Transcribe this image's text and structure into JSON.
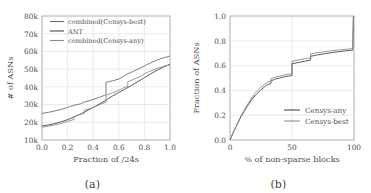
{
  "figure": {
    "panels": [
      {
        "caption": "(a)",
        "chart_data": {
          "type": "line",
          "title": "",
          "xlabel": "Fraction of /24s",
          "ylabel": "# of ASNs",
          "xlim": [
            0.0,
            1.0
          ],
          "ylim": [
            10000,
            80000
          ],
          "xticks": [
            0.0,
            0.2,
            0.4,
            0.6,
            0.8,
            1.0
          ],
          "xticklabels": [
            "0.0",
            "0.2",
            "0.4",
            "0.6",
            "0.8",
            "1.0"
          ],
          "yticks": [
            10000,
            20000,
            30000,
            40000,
            50000,
            60000,
            70000,
            80000
          ],
          "yticklabels": [
            "10k",
            "20k",
            "30k",
            "40k",
            "50k",
            "60k",
            "70k",
            "80k"
          ],
          "grid": true,
          "legend_position": "upper left",
          "series": [
            {
              "name": "combined(Censys-best)",
              "color": "#6f6f6f",
              "x": [
                0.0,
                0.05,
                0.1,
                0.15,
                0.2,
                0.25,
                0.3,
                0.33,
                0.38,
                0.42,
                0.46,
                0.5,
                0.5,
                0.55,
                0.6,
                0.63,
                0.67,
                0.7,
                0.75,
                0.8,
                0.85,
                0.9,
                0.95,
                1.0
              ],
              "y": [
                25000,
                25600,
                26400,
                27300,
                28400,
                29600,
                30400,
                31400,
                32400,
                33400,
                34400,
                35600,
                42600,
                43400,
                44400,
                45600,
                47400,
                48300,
                50000,
                51800,
                53600,
                55200,
                56400,
                57400
              ]
            },
            {
              "name": "ANT",
              "color": "#4a4a4a",
              "x": [
                0.0,
                0.05,
                0.1,
                0.15,
                0.2,
                0.25,
                0.3,
                0.35,
                0.4,
                0.45,
                0.5,
                0.55,
                0.6,
                0.65,
                0.7,
                0.75,
                0.8,
                0.85,
                0.9,
                0.95,
                1.0
              ],
              "y": [
                18000,
                18500,
                19300,
                20300,
                21500,
                23000,
                24600,
                26400,
                28400,
                30400,
                32600,
                34800,
                36800,
                38800,
                40800,
                43000,
                45200,
                47400,
                49400,
                51200,
                52800
              ]
            },
            {
              "name": "combined(Censys-any)",
              "color": "#8c8c8c",
              "x": [
                0.0,
                0.05,
                0.1,
                0.15,
                0.2,
                0.25,
                0.25,
                0.3,
                0.33,
                0.33,
                0.38,
                0.42,
                0.46,
                0.5,
                0.5,
                0.55,
                0.6,
                0.63,
                0.67,
                0.67,
                0.72,
                0.78,
                0.8,
                0.85,
                0.9,
                0.95,
                1.0
              ],
              "y": [
                17200,
                17800,
                18500,
                19400,
                20500,
                21600,
                23200,
                24400,
                25200,
                26800,
                27800,
                29000,
                30200,
                31400,
                35200,
                36600,
                38000,
                39200,
                40400,
                42800,
                44400,
                46200,
                47400,
                49000,
                50400,
                51600,
                52400
              ]
            }
          ]
        }
      },
      {
        "caption": "(b)",
        "chart_data": {
          "type": "line",
          "title": "",
          "xlabel": "% of non-sparse blocks",
          "ylabel": "Fraction of ASNs",
          "xlim": [
            0,
            100
          ],
          "ylim": [
            0.0,
            1.0
          ],
          "xticks": [
            0,
            50,
            100
          ],
          "xticklabels": [
            "0",
            "50",
            "100"
          ],
          "yticks": [
            0.0,
            0.2,
            0.4,
            0.6,
            0.8,
            1.0
          ],
          "yticklabels": [
            "0.0",
            "0.2",
            "0.4",
            "0.6",
            "0.8",
            "1.0"
          ],
          "grid": true,
          "legend_position": "lower right",
          "series": [
            {
              "name": "Censys-any",
              "color": "#4a4a4a",
              "x": [
                0,
                3,
                6,
                9,
                12,
                15,
                18,
                20,
                22,
                25,
                28,
                30,
                33,
                33,
                36,
                40,
                44,
                47,
                50,
                50,
                55,
                60,
                65,
                65,
                70,
                76,
                82,
                88,
                94,
                99,
                99.5,
                100
              ],
              "y": [
                0.0,
                0.07,
                0.13,
                0.19,
                0.24,
                0.29,
                0.33,
                0.355,
                0.375,
                0.405,
                0.43,
                0.445,
                0.455,
                0.475,
                0.49,
                0.5,
                0.51,
                0.515,
                0.52,
                0.615,
                0.625,
                0.635,
                0.645,
                0.675,
                0.685,
                0.695,
                0.705,
                0.712,
                0.72,
                0.725,
                0.99,
                1.0
              ]
            },
            {
              "name": "Censys-best",
              "color": "#8c8c8c",
              "x": [
                0,
                3,
                6,
                9,
                12,
                15,
                18,
                20,
                22,
                25,
                28,
                30,
                33,
                33,
                36,
                40,
                44,
                47,
                50,
                50,
                55,
                60,
                65,
                65,
                70,
                76,
                82,
                88,
                94,
                99,
                99.5,
                100
              ],
              "y": [
                0.0,
                0.07,
                0.135,
                0.2,
                0.25,
                0.3,
                0.345,
                0.375,
                0.395,
                0.425,
                0.45,
                0.465,
                0.475,
                0.495,
                0.505,
                0.515,
                0.525,
                0.53,
                0.535,
                0.635,
                0.645,
                0.655,
                0.663,
                0.695,
                0.703,
                0.712,
                0.72,
                0.726,
                0.732,
                0.737,
                0.99,
                1.0
              ]
            }
          ]
        }
      }
    ]
  }
}
